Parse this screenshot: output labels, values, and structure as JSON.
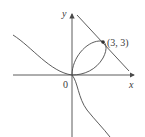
{
  "figure": {
    "equation": "x^3 + y^3 = 6xy",
    "tangent_line": "x + y = 6",
    "axis_labels": {
      "x": "x",
      "y": "y"
    },
    "origin_label": "0",
    "point": {
      "label": "(3, 3)",
      "x": 3,
      "y": 3
    },
    "colors": {
      "curve": "#4a4a4a",
      "axes": "#4a4a4a",
      "text": "#3a3a3a",
      "background": "#ffffff"
    }
  }
}
